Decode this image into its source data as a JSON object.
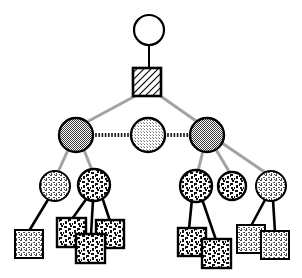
{
  "figure": {
    "background_color": "#ffffff",
    "width": 302,
    "height": 278
  },
  "palette": {
    "outline": "#000000",
    "white_fill": "#ffffff",
    "dark_gray_fill": "#8a8a8a",
    "light_gray_fill": "#d8d8d8",
    "tree_edge_gray": "#a0a0a0",
    "leaf_edge_black": "#000000",
    "hatch_line": "#000000",
    "speckle_dark": "#1a1a1a",
    "stipple_light": "#555555"
  },
  "legend_note": "",
  "nodes": [
    {
      "id": "root-circle",
      "name": "root-circle-node",
      "shape": "circle",
      "fill": "white",
      "cx": 149,
      "cy": 30,
      "r": 15,
      "level": 0
    },
    {
      "id": "root-square",
      "name": "root-hatched-square-node",
      "shape": "square",
      "fill": "diagonal-hatch",
      "x": 133,
      "y": 68,
      "size": 28,
      "level": 1
    },
    {
      "id": "mid-left",
      "name": "level2-circle-left",
      "shape": "circle",
      "fill": "dark-gray-dither",
      "cx": 76,
      "cy": 135,
      "r": 17,
      "level": 2
    },
    {
      "id": "mid-center",
      "name": "level2-circle-center",
      "shape": "circle",
      "fill": "light-gray-dither",
      "cx": 148,
      "cy": 135,
      "r": 17,
      "level": 2
    },
    {
      "id": "mid-right",
      "name": "level2-circle-right",
      "shape": "circle",
      "fill": "dark-gray-dither",
      "cx": 207,
      "cy": 135,
      "r": 17,
      "level": 2
    },
    {
      "id": "l3-a",
      "name": "level3-circle-1",
      "shape": "circle",
      "fill": "light-stipple",
      "cx": 55,
      "cy": 186,
      "r": 15,
      "level": 3
    },
    {
      "id": "l3-b",
      "name": "level3-circle-2",
      "shape": "circle",
      "fill": "dark-speckle",
      "cx": 94,
      "cy": 185,
      "r": 16,
      "level": 3
    },
    {
      "id": "l3-c",
      "name": "level3-circle-3",
      "shape": "circle",
      "fill": "dark-speckle",
      "cx": 196,
      "cy": 186,
      "r": 16,
      "level": 3
    },
    {
      "id": "l3-d",
      "name": "level3-circle-4",
      "shape": "circle",
      "fill": "dark-speckle",
      "cx": 232,
      "cy": 186,
      "r": 14,
      "level": 3
    },
    {
      "id": "l3-e",
      "name": "level3-circle-5",
      "shape": "circle",
      "fill": "light-stipple",
      "cx": 271,
      "cy": 186,
      "r": 15,
      "level": 3
    },
    {
      "id": "leaf-1",
      "name": "leaf-square-1",
      "shape": "square",
      "fill": "light-stipple",
      "x": 15,
      "y": 230,
      "size": 28,
      "level": 4
    },
    {
      "id": "leaf-2",
      "name": "leaf-square-2",
      "shape": "square",
      "fill": "dark-speckle",
      "x": 57,
      "y": 218,
      "size": 29,
      "level": 4
    },
    {
      "id": "leaf-3",
      "name": "leaf-square-3",
      "shape": "square",
      "fill": "dark-speckle",
      "x": 96,
      "y": 220,
      "size": 28,
      "level": 4
    },
    {
      "id": "leaf-4",
      "name": "leaf-square-4",
      "shape": "square",
      "fill": "dark-speckle",
      "x": 76,
      "y": 234,
      "size": 29,
      "level": 4
    },
    {
      "id": "leaf-5",
      "name": "leaf-square-5",
      "shape": "square",
      "fill": "dark-speckle",
      "x": 178,
      "y": 228,
      "size": 28,
      "level": 4
    },
    {
      "id": "leaf-6",
      "name": "leaf-square-6",
      "shape": "square",
      "fill": "dark-speckle",
      "x": 202,
      "y": 239,
      "size": 29,
      "level": 4
    },
    {
      "id": "leaf-7",
      "name": "leaf-square-7",
      "shape": "square",
      "fill": "light-stipple",
      "x": 237,
      "y": 225,
      "size": 28,
      "level": 4
    },
    {
      "id": "leaf-8",
      "name": "leaf-square-8",
      "shape": "square",
      "fill": "light-stipple",
      "x": 261,
      "y": 231,
      "size": 28,
      "level": 4
    }
  ],
  "edges": [
    {
      "name": "edge-root-circle-to-square",
      "from": "root-circle",
      "to": "root-square",
      "style": "solid-black",
      "x1": 149,
      "y1": 45,
      "x2": 149,
      "y2": 68
    },
    {
      "name": "edge-square-to-mid-left",
      "from": "root-square",
      "to": "mid-left",
      "style": "gray",
      "x1": 136,
      "y1": 96,
      "x2": 86,
      "y2": 122
    },
    {
      "name": "edge-square-to-mid-right",
      "from": "root-square",
      "to": "mid-right",
      "style": "gray",
      "x1": 159,
      "y1": 96,
      "x2": 198,
      "y2": 122
    },
    {
      "name": "edge-mid-left-to-center",
      "from": "mid-left",
      "to": "mid-center",
      "style": "dotted-thick",
      "x1": 93,
      "y1": 135,
      "x2": 131,
      "y2": 135
    },
    {
      "name": "edge-mid-center-to-right",
      "from": "mid-center",
      "to": "mid-right",
      "style": "dotted-thick",
      "x1": 165,
      "y1": 135,
      "x2": 190,
      "y2": 135
    },
    {
      "name": "edge-mid-left-to-l3a",
      "from": "mid-left",
      "to": "l3-a",
      "style": "gray",
      "x1": 68,
      "y1": 151,
      "x2": 58,
      "y2": 171
    },
    {
      "name": "edge-mid-left-to-l3b",
      "from": "mid-left",
      "to": "l3-b",
      "style": "gray",
      "x1": 84,
      "y1": 151,
      "x2": 92,
      "y2": 169
    },
    {
      "name": "edge-mid-right-to-l3c",
      "from": "mid-right",
      "to": "l3-c",
      "style": "gray",
      "x1": 203,
      "y1": 152,
      "x2": 197,
      "y2": 170
    },
    {
      "name": "edge-mid-right-to-l3d",
      "from": "mid-right",
      "to": "l3-d",
      "style": "gray",
      "x1": 214,
      "y1": 149,
      "x2": 229,
      "y2": 172
    },
    {
      "name": "edge-mid-right-to-l3e",
      "from": "mid-right",
      "to": "l3-e",
      "style": "gray",
      "x1": 221,
      "y1": 144,
      "x2": 266,
      "y2": 172
    },
    {
      "name": "edge-l3a-to-leaf1",
      "from": "l3-a",
      "to": "leaf-1",
      "style": "solid-black",
      "x1": 49,
      "y1": 199,
      "x2": 29,
      "y2": 230
    },
    {
      "name": "edge-l3b-to-leaf2",
      "from": "l3-b",
      "to": "leaf-2",
      "style": "solid-black",
      "x1": 88,
      "y1": 199,
      "x2": 72,
      "y2": 218
    },
    {
      "name": "edge-l3b-to-leaf4",
      "from": "l3-b",
      "to": "leaf-4",
      "style": "solid-black",
      "x1": 94,
      "y1": 201,
      "x2": 91,
      "y2": 234
    },
    {
      "name": "edge-l3b-to-leaf3",
      "from": "l3-b",
      "to": "leaf-3",
      "style": "solid-black",
      "x1": 102,
      "y1": 198,
      "x2": 110,
      "y2": 220
    },
    {
      "name": "edge-l3c-to-leaf5",
      "from": "l3-c",
      "to": "leaf-5",
      "style": "solid-black",
      "x1": 192,
      "y1": 200,
      "x2": 189,
      "y2": 228
    },
    {
      "name": "edge-l3c-to-leaf6",
      "from": "l3-c",
      "to": "leaf-6",
      "style": "solid-black",
      "x1": 202,
      "y1": 200,
      "x2": 216,
      "y2": 239
    },
    {
      "name": "edge-l3e-to-leaf7",
      "from": "l3-e",
      "to": "leaf-7",
      "style": "solid-black",
      "x1": 266,
      "y1": 199,
      "x2": 251,
      "y2": 225
    },
    {
      "name": "edge-l3e-to-leaf8",
      "from": "l3-e",
      "to": "leaf-8",
      "style": "solid-black",
      "x1": 273,
      "y1": 201,
      "x2": 275,
      "y2": 231
    }
  ]
}
